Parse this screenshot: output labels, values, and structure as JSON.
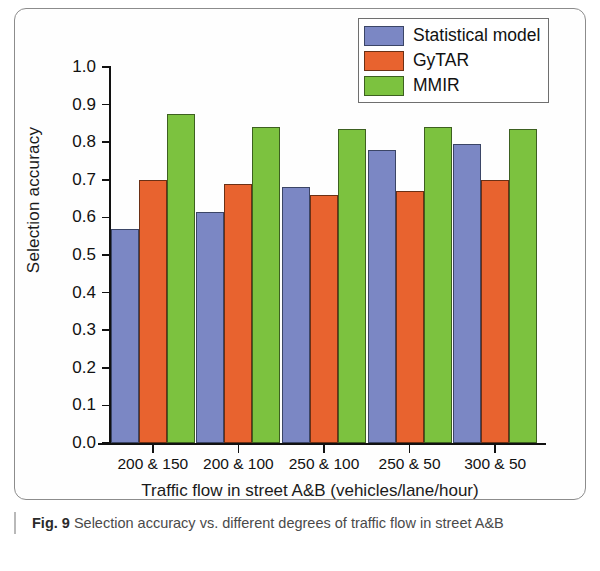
{
  "figure": {
    "caption_figno": "Fig. 9",
    "caption_text": "Selection accuracy vs. different degrees of traffic flow in street A&B"
  },
  "legend": {
    "position": "top-right",
    "entries": [
      {
        "label": "Statistical model",
        "color": "#7b87c4"
      },
      {
        "label": "GyTAR",
        "color": "#e8632f"
      },
      {
        "label": "MMIR",
        "color": "#7cc23f"
      }
    ]
  },
  "chart_data": {
    "type": "bar",
    "title": "",
    "xlabel": "Traffic flow in street A&B (vehicles/lane/hour)",
    "ylabel": "Selection accuracy",
    "categories": [
      "200 & 150",
      "200 & 100",
      "250 & 100",
      "250 & 50",
      "300 & 50"
    ],
    "series": [
      {
        "name": "Statistical model",
        "color": "#7b87c4",
        "values": [
          0.57,
          0.615,
          0.68,
          0.78,
          0.795
        ]
      },
      {
        "name": "GyTAR",
        "color": "#e8632f",
        "values": [
          0.7,
          0.69,
          0.66,
          0.67,
          0.7
        ]
      },
      {
        "name": "MMIR",
        "color": "#7cc23f",
        "values": [
          0.875,
          0.84,
          0.835,
          0.84,
          0.835
        ]
      }
    ],
    "ylim": [
      0.0,
      1.0
    ],
    "ytick_labels": [
      "0.0",
      "0.1",
      "0.2",
      "0.3",
      "0.4",
      "0.5",
      "0.6",
      "0.7",
      "0.8",
      "0.9",
      "1.0"
    ],
    "ytick_values": [
      0.0,
      0.1,
      0.2,
      0.3,
      0.4,
      0.5,
      0.6,
      0.7,
      0.8,
      0.9,
      1.0
    ],
    "grid": false,
    "legend_position": "top-right"
  }
}
